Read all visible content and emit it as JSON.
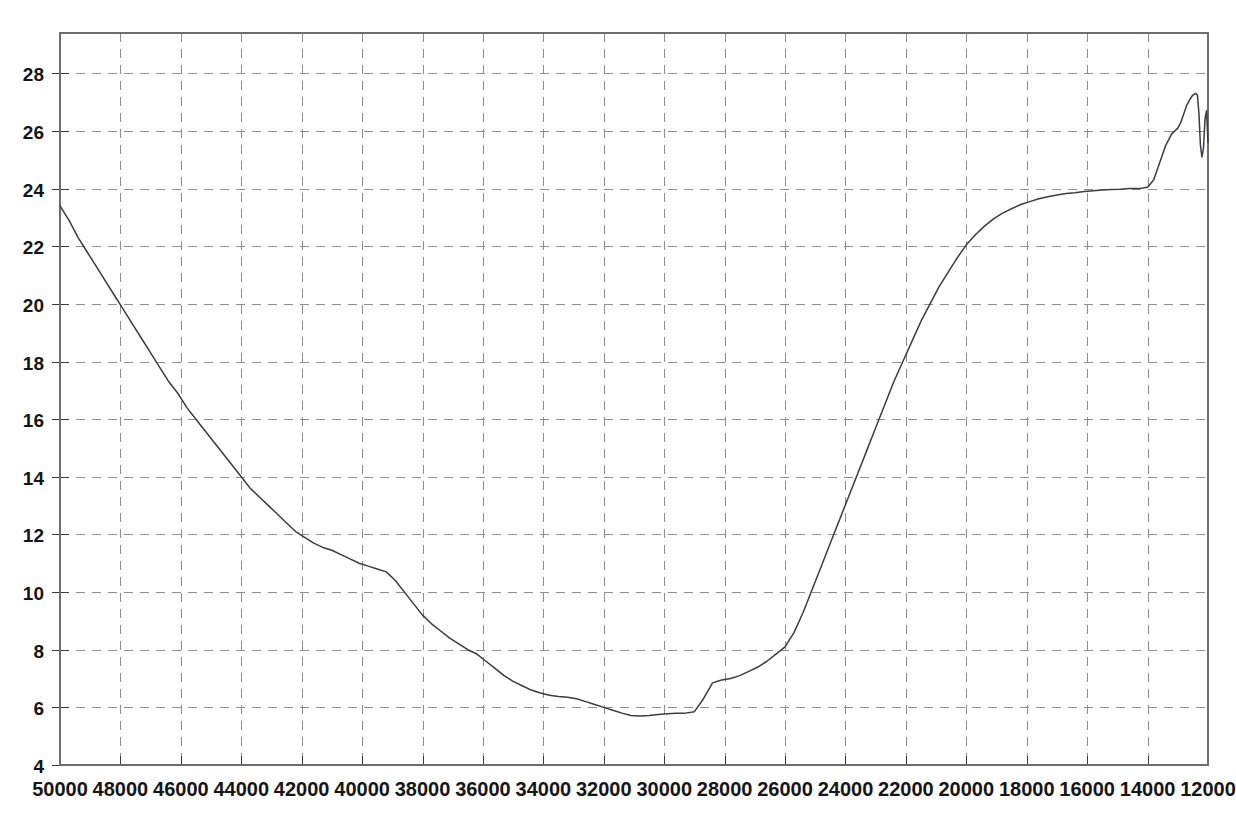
{
  "chart_data": {
    "type": "line",
    "title": "",
    "subtitle": "",
    "xlabel": "",
    "ylabel": "",
    "xlim": [
      50000,
      12000
    ],
    "ylim": [
      4,
      29.4
    ],
    "x_axis_reversed": true,
    "grid": true,
    "legend": null,
    "legend_position": "none",
    "line_color": "#3c3c40",
    "grid_color": "#8d8d94",
    "background_color": "#ffffff",
    "xticks": [
      50000,
      48000,
      46000,
      44000,
      42000,
      40000,
      38000,
      36000,
      34000,
      32000,
      30000,
      28000,
      26000,
      24000,
      22000,
      20000,
      18000,
      16000,
      14000,
      12000
    ],
    "xtick_labels": [
      "50000",
      "48000",
      "46000",
      "44000",
      "42000",
      "40000",
      "38000",
      "36000",
      "34000",
      "32000",
      "30000",
      "28000",
      "26000",
      "24000",
      "22000",
      "20000",
      "18000",
      "16000",
      "14000",
      "12000"
    ],
    "yticks": [
      4,
      6,
      8,
      10,
      12,
      14,
      16,
      18,
      20,
      22,
      24,
      26,
      28
    ],
    "ytick_labels": [
      "4",
      "6",
      "8",
      "10",
      "12",
      "14",
      "16",
      "18",
      "20",
      "22",
      "24",
      "26",
      "28"
    ],
    "series": [
      {
        "name": "trace",
        "x": [
          50000,
          49700,
          49400,
          49100,
          48800,
          48500,
          48200,
          47900,
          47600,
          47300,
          47000,
          46700,
          46400,
          46100,
          45800,
          45500,
          45200,
          44900,
          44600,
          44300,
          44000,
          43700,
          43400,
          43100,
          42800,
          42500,
          42200,
          41900,
          41600,
          41300,
          41000,
          40700,
          40400,
          40100,
          39800,
          39500,
          39200,
          38900,
          38600,
          38300,
          38000,
          37700,
          37400,
          37100,
          36800,
          36500,
          36200,
          35900,
          35600,
          35300,
          35000,
          34700,
          34400,
          34100,
          33800,
          33500,
          33200,
          32900,
          32600,
          32300,
          32000,
          31700,
          31400,
          31100,
          30800,
          30500,
          30200,
          29900,
          29600,
          29300,
          29000,
          28700,
          28400,
          28100,
          27800,
          27500,
          27200,
          26900,
          26600,
          26300,
          26000,
          25700,
          25400,
          25100,
          24800,
          24500,
          24200,
          23900,
          23600,
          23300,
          23000,
          22700,
          22400,
          22100,
          21800,
          21500,
          21200,
          20900,
          20600,
          20300,
          20000,
          19700,
          19400,
          19100,
          18800,
          18500,
          18200,
          17900,
          17600,
          17300,
          17000,
          16700,
          16400,
          16100,
          15800,
          15500,
          15200,
          14900,
          14600,
          14300,
          14000,
          13800,
          13600,
          13400,
          13200,
          13000,
          12900,
          12800,
          12700,
          12600,
          12500,
          12400,
          12350,
          12300,
          12250,
          12200,
          12150,
          12100,
          12050,
          12000
        ],
        "y": [
          23.4,
          22.9,
          22.3,
          21.8,
          21.3,
          20.8,
          20.3,
          19.8,
          19.3,
          18.8,
          18.3,
          17.8,
          17.3,
          16.9,
          16.4,
          16.0,
          15.6,
          15.2,
          14.8,
          14.4,
          14.0,
          13.6,
          13.3,
          13.0,
          12.7,
          12.4,
          12.1,
          11.9,
          11.7,
          11.55,
          11.45,
          11.3,
          11.15,
          11.0,
          10.9,
          10.8,
          10.7,
          10.4,
          10.0,
          9.6,
          9.2,
          8.9,
          8.65,
          8.4,
          8.2,
          8.0,
          7.85,
          7.6,
          7.35,
          7.1,
          6.9,
          6.75,
          6.6,
          6.5,
          6.42,
          6.38,
          6.35,
          6.3,
          6.2,
          6.1,
          6.0,
          5.9,
          5.8,
          5.72,
          5.7,
          5.72,
          5.75,
          5.78,
          5.8,
          5.8,
          5.85,
          6.3,
          6.85,
          6.95,
          7.0,
          7.1,
          7.25,
          7.4,
          7.6,
          7.85,
          8.1,
          8.6,
          9.3,
          10.1,
          10.9,
          11.7,
          12.5,
          13.3,
          14.1,
          14.9,
          15.7,
          16.5,
          17.3,
          18.0,
          18.7,
          19.4,
          20.0,
          20.6,
          21.1,
          21.6,
          22.05,
          22.4,
          22.7,
          22.95,
          23.15,
          23.3,
          23.45,
          23.55,
          23.65,
          23.72,
          23.78,
          23.83,
          23.86,
          23.9,
          23.93,
          23.95,
          23.97,
          23.98,
          24.0,
          24.0,
          24.05,
          24.3,
          24.9,
          25.5,
          25.9,
          26.1,
          26.3,
          26.6,
          26.9,
          27.1,
          27.25,
          27.3,
          27.25,
          26.6,
          25.5,
          25.1,
          25.4,
          26.4,
          26.7,
          25.6
        ]
      }
    ],
    "annotations": {
      "start_value": 23.4,
      "minimum_value": 5.7,
      "minimum_x": 33500,
      "maximum_value": 27.3,
      "maximum_x": 12400,
      "plateau_value": 24.0,
      "plateau_range": [
        20000,
        14500
      ]
    }
  },
  "figure": {
    "width": 1236,
    "height": 823,
    "plot_left": 60,
    "plot_right": 1208,
    "plot_top": 33,
    "plot_bottom": 765
  }
}
